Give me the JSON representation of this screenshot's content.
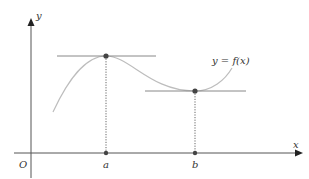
{
  "diagram": {
    "axes": {
      "x_label": "x",
      "y_label": "y",
      "origin_label": "O"
    },
    "curve_label": "y = f(x)",
    "points": [
      {
        "name": "a",
        "label": "a",
        "type": "local maximum"
      },
      {
        "name": "b",
        "label": "b",
        "type": "local minimum"
      }
    ],
    "colors": {
      "axis": "#333333",
      "curve": "#b8b8b8",
      "tangent": "#888888",
      "dot": "#444444",
      "text": "#333333"
    }
  }
}
